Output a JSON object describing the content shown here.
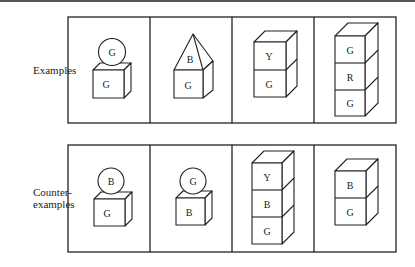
{
  "rows": [
    {
      "label": "Examples",
      "cells": [
        {
          "type": "ball-on-block",
          "ball": "G",
          "block": "G"
        },
        {
          "type": "pyramid-on-block",
          "pyramid": "B",
          "block": "G"
        },
        {
          "type": "stack",
          "blocks": [
            "Y",
            "G"
          ]
        },
        {
          "type": "stack",
          "blocks": [
            "G",
            "R",
            "G"
          ]
        }
      ]
    },
    {
      "label_line1": "Counter-",
      "label_line2": "examples",
      "cells": [
        {
          "type": "ball-on-block",
          "ball": "B",
          "block": "G"
        },
        {
          "type": "ball-on-block",
          "ball": "G",
          "block": "B"
        },
        {
          "type": "stack",
          "blocks": [
            "Y",
            "B",
            "G"
          ]
        },
        {
          "type": "stack",
          "blocks": [
            "B",
            "G"
          ]
        }
      ]
    }
  ],
  "letters": {
    "r0c0_ball": "G",
    "r0c0_block": "G",
    "r0c1_pyr": "B",
    "r0c1_block": "G",
    "r0c2_b0": "Y",
    "r0c2_b1": "G",
    "r0c3_b0": "G",
    "r0c3_b1": "R",
    "r0c3_b2": "G",
    "r1c0_ball": "B",
    "r1c0_block": "G",
    "r1c1_ball": "G",
    "r1c1_block": "B",
    "r1c2_b0": "Y",
    "r1c2_b1": "B",
    "r1c2_b2": "G",
    "r1c3_b0": "B",
    "r1c3_b1": "G"
  }
}
